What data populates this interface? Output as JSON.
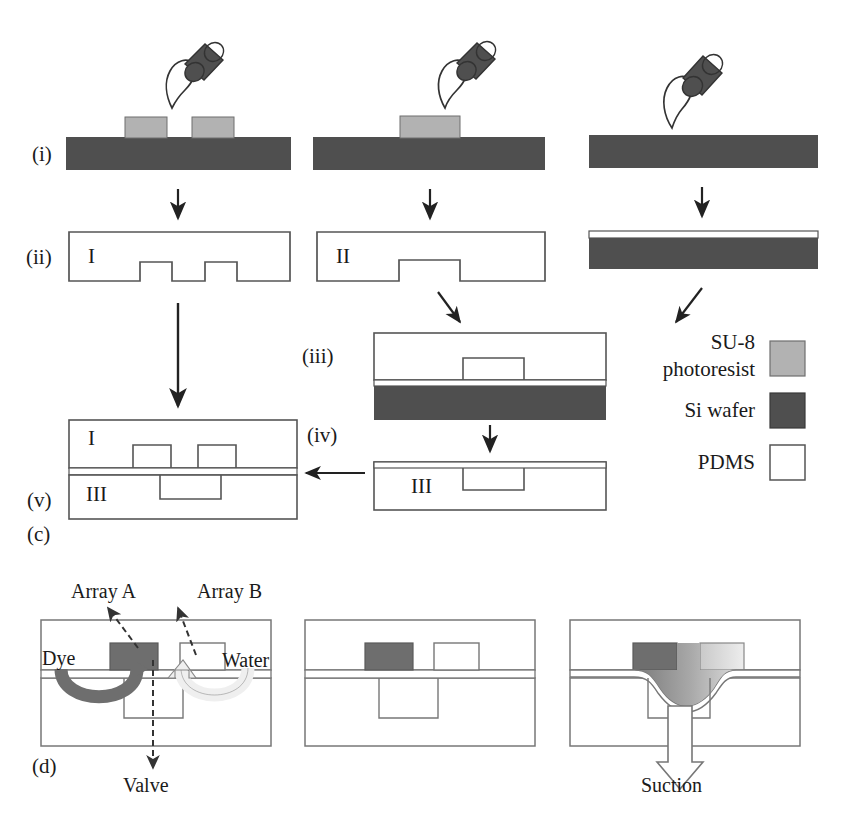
{
  "figure": {
    "panels": [
      {
        "key": "c",
        "label": "(c)"
      },
      {
        "key": "d",
        "label": "(d)"
      }
    ]
  },
  "colors": {
    "su8_photoresist": "#b2b2b2",
    "si_wafer": "#4f4f4f",
    "pdms": "#ffffff",
    "outline": "#555555",
    "dye": "#6e6e6e",
    "water": "#f2f2f2",
    "arrow": "#222222",
    "background": "#ffffff"
  },
  "legend": {
    "items": [
      {
        "label": "SU-8\nphotoresist",
        "label_line1": "SU-8",
        "label_line2": "photoresist",
        "swatch": "su8_photoresist"
      },
      {
        "label": "Si wafer",
        "label_line1": "Si wafer",
        "label_line2": "",
        "swatch": "si_wafer"
      },
      {
        "label": "PDMS",
        "label_line1": "PDMS",
        "label_line2": "",
        "swatch": "pdms"
      }
    ]
  },
  "panel_c": {
    "step_labels": {
      "i": "(i)",
      "ii": "(ii)",
      "iii": "(iii)",
      "iv": "(iv)",
      "v": "(v)"
    },
    "mold_ids": {
      "mold_one": "I",
      "mold_two": "II",
      "mold_three": "III",
      "assembly_top": "I",
      "assembly_bottom": "III",
      "bonded_third": "III"
    },
    "columns": [
      {
        "name": "column-left",
        "step_i_desc": "Si wafer with two SU-8 photoresist features and PDMS pour",
        "su8_block_count": 2,
        "step_ii_id": "I"
      },
      {
        "name": "column-middle",
        "step_i_desc": "Si wafer with one SU-8 photoresist feature and PDMS pour",
        "su8_block_count": 1,
        "step_ii_id": "II"
      },
      {
        "name": "column-right",
        "step_i_desc": "Bare Si wafer with PDMS pour to form thin membrane",
        "su8_block_count": 0,
        "step_ii_id": ""
      }
    ]
  },
  "panel_d": {
    "annotations": {
      "array_a": "Array A",
      "array_b": "Array B",
      "dye": "Dye",
      "water": "Water",
      "valve": "Valve",
      "suction": "Suction"
    },
    "states": [
      {
        "name": "loading",
        "caption": "Dye and water loaded into Array A and Array B chambers; valve below"
      },
      {
        "name": "sealed",
        "caption": "Membrane flat, chambers isolated"
      },
      {
        "name": "actuated",
        "caption": "Suction deflects membrane downward, merging chambers"
      }
    ]
  }
}
